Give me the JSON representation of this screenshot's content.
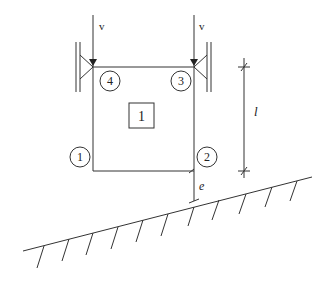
{
  "diagram": {
    "load_labels": [
      "v",
      "v"
    ],
    "node_labels": [
      "1",
      "2",
      "3",
      "4"
    ],
    "element_label": "1",
    "dimension_label": "l",
    "eccentricity_label": "e",
    "colors": {
      "line": "#333333",
      "background": "#ffffff"
    }
  }
}
